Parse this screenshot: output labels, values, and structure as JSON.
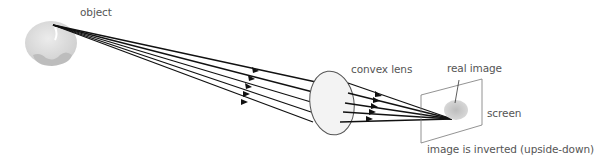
{
  "diagram": {
    "labels": {
      "object": "object",
      "lens": "convex lens",
      "real_image": "real image",
      "screen": "screen",
      "inverted": "image is inverted (upside-down)"
    },
    "colors": {
      "ray": "#111111",
      "object_fill": "#dcdcdc",
      "object_shadow": "#bdbdbd",
      "lens_fill": "#f2f2f2",
      "lens_stroke": "#555555",
      "screen_stroke": "#777777",
      "image_fill": "#c8c8c8",
      "text": "#555555"
    },
    "geometry": {
      "source_point": [
        53,
        25
      ],
      "image_point": [
        452,
        119
      ],
      "lens_center": [
        331,
        104
      ],
      "rays_count": 5
    }
  }
}
